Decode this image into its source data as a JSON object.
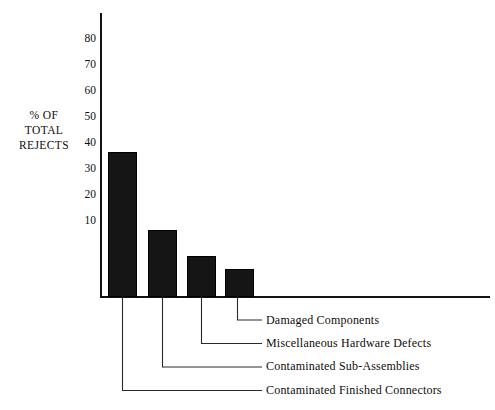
{
  "chart_data": {
    "type": "bar",
    "title": "",
    "subtitle": "",
    "xlabel": "",
    "ylabel": "% OF TOTAL REJECTS",
    "ylabel_lines": [
      "% OF",
      "TOTAL",
      "REJECTS"
    ],
    "categories": [
      "Contaminated Finished Connectors",
      "Contaminated Sub-Assemblies",
      "Miscellaneous Hardware Defects",
      "Damaged Components"
    ],
    "values": [
      56,
      26,
      16,
      11
    ],
    "ylim": [
      0,
      85
    ],
    "yticks": [
      10,
      20,
      30,
      40,
      50,
      60,
      70,
      80
    ],
    "ytick_labels": [
      "10",
      "20",
      "30",
      "40",
      "50",
      "60",
      "70",
      "80"
    ],
    "grid": false,
    "legend_position": "below-right-leader-lines",
    "bar_color": "#151515",
    "axis_color": "#121212",
    "background_color": "#ffffff"
  },
  "legend": {
    "entries": [
      {
        "label": "Damaged Components",
        "bar_index": 3
      },
      {
        "label": "Miscellaneous Hardware Defects",
        "bar_index": 2
      },
      {
        "label": "Contaminated Sub-Assemblies",
        "bar_index": 1
      },
      {
        "label": "Contaminated Finished Connectors",
        "bar_index": 0
      }
    ]
  }
}
